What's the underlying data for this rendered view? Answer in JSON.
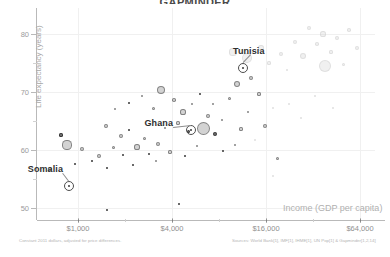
{
  "chart_data": {
    "type": "scatter",
    "title": "GAPMINDER",
    "xlabel": "Income (GDP per capita)",
    "ylabel": "Life expectancy (years)",
    "x_scale": "log",
    "x_ticks": [
      "$1,000",
      "$4,000",
      "$16,000",
      "$64,000"
    ],
    "x_tick_values": [
      1000,
      4000,
      16000,
      64000
    ],
    "y_ticks": [
      "80",
      "70",
      "60",
      "50"
    ],
    "y_tick_values": [
      80,
      70,
      60,
      50
    ],
    "ylim": [
      47,
      86
    ],
    "xlim": [
      500,
      90000
    ],
    "grid": true,
    "legend": "none",
    "footnote_left": "Constant 2011 dollars, adjusted for price differences.",
    "footnote_right": "Sources: World Bank[1], IMF[1], IHME[1], UN Pop[1] & Gapminder[1,2,14]",
    "annotations": [
      {
        "label": "Somalia",
        "x": 1050,
        "y": 59.5,
        "income": 1050,
        "life_expectancy": 59.5
      },
      {
        "label": "Ghana",
        "x": 4200,
        "y": 66.0,
        "income": 4200,
        "life_expectancy": 66.0
      },
      {
        "label": "Tunisia",
        "x": 11000,
        "y": 77.5,
        "income": 11000,
        "life_expectancy": 77.5
      }
    ],
    "bubbles": [
      {
        "cx": 13,
        "cy": 161,
        "r": 2.4,
        "shade": "mid"
      },
      {
        "cx": 30,
        "cy": 137,
        "r": 4.6,
        "shade": "mid"
      },
      {
        "cx": 24,
        "cy": 127,
        "r": 1.6,
        "shade": "dark"
      },
      {
        "cx": 45,
        "cy": 141,
        "r": 2.0,
        "shade": "mid"
      },
      {
        "cx": 38,
        "cy": 156,
        "r": 1.3,
        "shade": "dark"
      },
      {
        "cx": 55,
        "cy": 153,
        "r": 1.2,
        "shade": "dark"
      },
      {
        "cx": 62,
        "cy": 148,
        "r": 2.2,
        "shade": "mid"
      },
      {
        "cx": 70,
        "cy": 160,
        "r": 1.4,
        "shade": "dark"
      },
      {
        "cx": 76,
        "cy": 139,
        "r": 1.5,
        "shade": "mid"
      },
      {
        "cx": 86,
        "cy": 147,
        "r": 1.3,
        "shade": "dark"
      },
      {
        "cx": 69,
        "cy": 118,
        "r": 1.9,
        "shade": "mid"
      },
      {
        "cx": 84,
        "cy": 128,
        "r": 2.1,
        "shade": "mid"
      },
      {
        "cx": 92,
        "cy": 122,
        "r": 1.3,
        "shade": "dark"
      },
      {
        "cx": 100,
        "cy": 139,
        "r": 2.6,
        "shade": "mid"
      },
      {
        "cx": 107,
        "cy": 130,
        "r": 1.5,
        "shade": "mid"
      },
      {
        "cx": 112,
        "cy": 146,
        "r": 1.4,
        "shade": "dark"
      },
      {
        "cx": 96,
        "cy": 157,
        "r": 1.2,
        "shade": "dark"
      },
      {
        "cx": 119,
        "cy": 153,
        "r": 1.3,
        "shade": "mid"
      },
      {
        "cx": 121,
        "cy": 136,
        "r": 2.0,
        "shade": "mid"
      },
      {
        "cx": 128,
        "cy": 120,
        "r": 1.4,
        "shade": "mid"
      },
      {
        "cx": 78,
        "cy": 101,
        "r": 1.4,
        "shade": "mid"
      },
      {
        "cx": 92,
        "cy": 95,
        "r": 1.2,
        "shade": "dark"
      },
      {
        "cx": 105,
        "cy": 88,
        "r": 1.3,
        "shade": "mid"
      },
      {
        "cx": 116,
        "cy": 100,
        "r": 1.5,
        "shade": "mid"
      },
      {
        "cx": 124,
        "cy": 82,
        "r": 4.2,
        "shade": "mid"
      },
      {
        "cx": 137,
        "cy": 92,
        "r": 1.8,
        "shade": "mid"
      },
      {
        "cx": 146,
        "cy": 104,
        "r": 2.6,
        "shade": "mid"
      },
      {
        "cx": 141,
        "cy": 115,
        "r": 1.6,
        "shade": "mid"
      },
      {
        "cx": 151,
        "cy": 123,
        "r": 1.5,
        "shade": "dark"
      },
      {
        "cx": 133,
        "cy": 144,
        "r": 1.6,
        "shade": "mid"
      },
      {
        "cx": 148,
        "cy": 148,
        "r": 1.4,
        "shade": "dark"
      },
      {
        "cx": 160,
        "cy": 138,
        "r": 1.3,
        "shade": "mid"
      },
      {
        "cx": 155,
        "cy": 96,
        "r": 1.4,
        "shade": "mid"
      },
      {
        "cx": 163,
        "cy": 86,
        "r": 1.3,
        "shade": "dark"
      },
      {
        "cx": 171,
        "cy": 108,
        "r": 2.2,
        "shade": "mid"
      },
      {
        "cx": 166,
        "cy": 120,
        "r": 6.5,
        "shade": "mid"
      },
      {
        "cx": 178,
        "cy": 126,
        "r": 2.0,
        "shade": "dark"
      },
      {
        "cx": 185,
        "cy": 112,
        "r": 1.4,
        "shade": "mid"
      },
      {
        "cx": 176,
        "cy": 96,
        "r": 1.2,
        "shade": "mid"
      },
      {
        "cx": 192,
        "cy": 90,
        "r": 1.5,
        "shade": "mid"
      },
      {
        "cx": 186,
        "cy": 143,
        "r": 1.3,
        "shade": "dark"
      },
      {
        "cx": 198,
        "cy": 137,
        "r": 1.2,
        "shade": "mid"
      },
      {
        "cx": 204,
        "cy": 121,
        "r": 1.6,
        "shade": "mid"
      },
      {
        "cx": 211,
        "cy": 104,
        "r": 1.4,
        "shade": "mid"
      },
      {
        "cx": 200,
        "cy": 76,
        "r": 3.4,
        "shade": "mid"
      },
      {
        "cx": 214,
        "cy": 70,
        "r": 2.4,
        "shade": "mid"
      },
      {
        "cx": 222,
        "cy": 86,
        "r": 1.6,
        "shade": "mid"
      },
      {
        "cx": 228,
        "cy": 118,
        "r": 2.0,
        "shade": "mid"
      },
      {
        "cx": 218,
        "cy": 132,
        "r": 1.3,
        "shade": "pale"
      },
      {
        "cx": 236,
        "cy": 100,
        "r": 1.4,
        "shade": "pale"
      },
      {
        "cx": 196,
        "cy": 44,
        "r": 3.6,
        "shade": "pale"
      },
      {
        "cx": 210,
        "cy": 50,
        "r": 5.0,
        "shade": "pale"
      },
      {
        "cx": 224,
        "cy": 40,
        "r": 2.6,
        "shade": "pale"
      },
      {
        "cx": 232,
        "cy": 55,
        "r": 1.6,
        "shade": "pale"
      },
      {
        "cx": 244,
        "cy": 46,
        "r": 2.2,
        "shade": "pale"
      },
      {
        "cx": 250,
        "cy": 62,
        "r": 1.4,
        "shade": "pale"
      },
      {
        "cx": 258,
        "cy": 34,
        "r": 2.0,
        "shade": "pale"
      },
      {
        "cx": 266,
        "cy": 48,
        "r": 3.0,
        "shade": "pale"
      },
      {
        "cx": 272,
        "cy": 20,
        "r": 2.4,
        "shade": "pale"
      },
      {
        "cx": 280,
        "cy": 36,
        "r": 1.8,
        "shade": "pale"
      },
      {
        "cx": 286,
        "cy": 26,
        "r": 2.6,
        "shade": "pale"
      },
      {
        "cx": 294,
        "cy": 44,
        "r": 1.6,
        "shade": "pale"
      },
      {
        "cx": 300,
        "cy": 30,
        "r": 2.0,
        "shade": "pale"
      },
      {
        "cx": 288,
        "cy": 58,
        "r": 6.2,
        "shade": "pale"
      },
      {
        "cx": 306,
        "cy": 56,
        "r": 1.5,
        "shade": "pale"
      },
      {
        "cx": 312,
        "cy": 22,
        "r": 1.8,
        "shade": "pale"
      },
      {
        "cx": 320,
        "cy": 40,
        "r": 2.2,
        "shade": "pale"
      },
      {
        "cx": 252,
        "cy": 96,
        "r": 1.3,
        "shade": "pale"
      },
      {
        "cx": 264,
        "cy": 110,
        "r": 1.2,
        "shade": "pale"
      },
      {
        "cx": 278,
        "cy": 88,
        "r": 1.4,
        "shade": "pale"
      },
      {
        "cx": 296,
        "cy": 100,
        "r": 1.2,
        "shade": "pale"
      },
      {
        "cx": 240,
        "cy": 150,
        "r": 1.5,
        "shade": "mid"
      },
      {
        "cx": 142,
        "cy": 196,
        "r": 1.0,
        "shade": "dark"
      },
      {
        "cx": 70,
        "cy": 202,
        "r": 1.0,
        "shade": "dark"
      },
      {
        "cx": 236,
        "cy": 168,
        "r": 1.0,
        "shade": "pale"
      }
    ],
    "highlights": [
      {
        "name": "somalia",
        "cx": 32,
        "cy": 178,
        "r": 5.2
      },
      {
        "name": "ghana",
        "cx": 154,
        "cy": 122,
        "r": 5.0
      },
      {
        "name": "tunisia",
        "cx": 206,
        "cy": 60,
        "r": 5.0
      }
    ]
  }
}
